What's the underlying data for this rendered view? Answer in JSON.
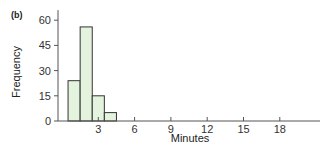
{
  "panel_label": "(b)",
  "colors": {
    "bar_fill": "#e3f3de",
    "bar_stroke": "#333333",
    "axis": "#555555"
  },
  "chart_data": {
    "type": "bar",
    "title": "",
    "xlabel": "Minutes",
    "ylabel": "Frequency",
    "bin_width": 1,
    "categories": [
      "0.5-1.5",
      "1.5-2.5",
      "2.5-3.5",
      "3.5-4.5"
    ],
    "bin_centers": [
      1,
      2,
      3,
      4
    ],
    "values": [
      24,
      56,
      15,
      5
    ],
    "xticks": [
      3,
      6,
      9,
      12,
      15,
      18
    ],
    "yticks": [
      0,
      15,
      30,
      45,
      60
    ],
    "xlim": [
      0,
      21
    ],
    "ylim": [
      0,
      66
    ],
    "grid": false,
    "legend": null
  }
}
